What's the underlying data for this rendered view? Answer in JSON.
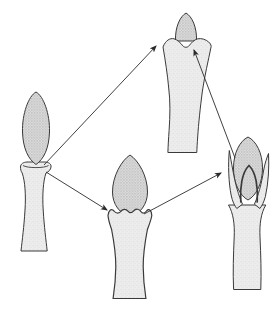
{
  "diagram": {
    "type": "pathway-diagram",
    "background": "#ffffff",
    "colors": {
      "outline": "#3a3a3a",
      "arrow": "#2b2b2b",
      "bud_fill": "#dedede",
      "bud_dot": "#8f8f8f",
      "bud_dot2": "#a6a6a6",
      "stalk_fill": "#ececec",
      "stalk_dot": "#c6c6c6",
      "stalk_dot2": "#d4d4d4"
    },
    "nodes": [
      {
        "id": "stage-exposed-bud",
        "position": "left"
      },
      {
        "id": "stage-enclosed-bud",
        "position": "top-center"
      },
      {
        "id": "stage-clasped-bud",
        "position": "bottom-center"
      },
      {
        "id": "stage-long-lobed-bud",
        "position": "right"
      }
    ],
    "arrows": [
      {
        "from": "stage-exposed-bud",
        "to": "stage-enclosed-bud",
        "x1": 44,
        "y1": 165,
        "x2": 156,
        "y2": 46
      },
      {
        "from": "stage-exposed-bud",
        "to": "stage-clasped-bud",
        "x1": 46,
        "y1": 172,
        "x2": 107,
        "y2": 210
      },
      {
        "from": "stage-clasped-bud",
        "to": "stage-long-lobed-bud",
        "x1": 144,
        "y1": 214,
        "x2": 221,
        "y2": 173
      },
      {
        "from": "stage-long-lobed-bud",
        "to": "stage-enclosed-bud",
        "x1": 235,
        "y1": 158,
        "x2": 194,
        "y2": 50
      }
    ]
  }
}
